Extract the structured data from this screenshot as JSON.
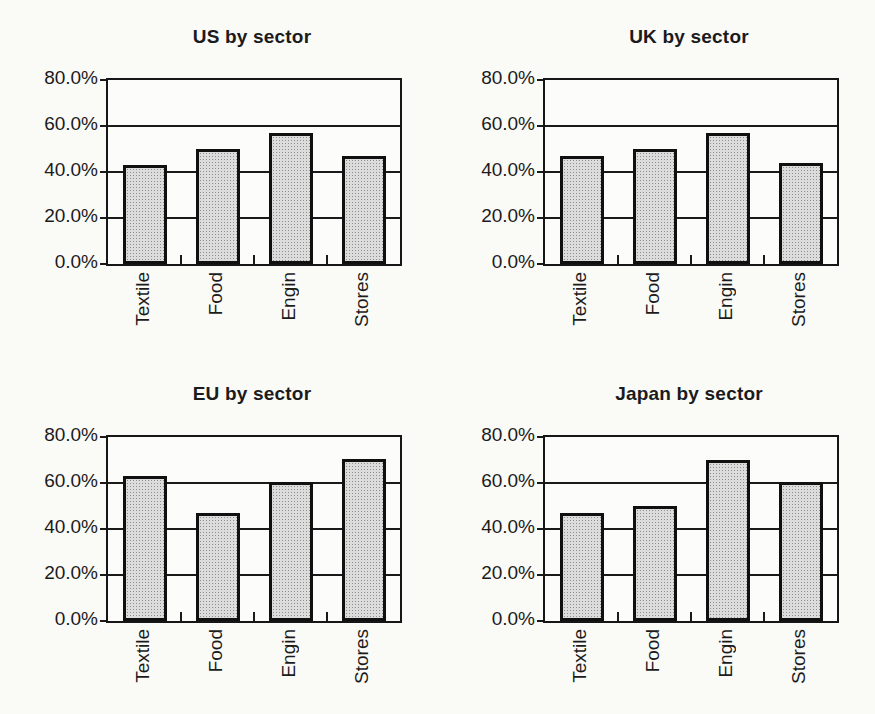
{
  "figure": {
    "background": "#fafaf7",
    "text_color": "#1b1b1b",
    "bar_fill": "#dcdcdc",
    "bar_border": "#101010"
  },
  "chart_data": [
    {
      "type": "bar",
      "title": "US by sector",
      "categories": [
        "Textile",
        "Food",
        "Engin",
        "Stores"
      ],
      "values": [
        43,
        50,
        57,
        47
      ],
      "xlabel": "",
      "ylabel": "",
      "ylim": [
        0,
        80
      ],
      "ytick_labels": [
        "80.0%",
        "60.0%",
        "40.0%",
        "20.0%",
        "0.0%"
      ],
      "ytick_values": [
        80,
        60,
        40,
        20,
        0
      ],
      "gridline_values": [
        20,
        40,
        60
      ],
      "grid": true,
      "legend": false,
      "bar_fill": "#dcdcdc",
      "bar_border": "#101010"
    },
    {
      "type": "bar",
      "title": "UK by sector",
      "categories": [
        "Textile",
        "Food",
        "Engin",
        "Stores"
      ],
      "values": [
        47,
        50,
        57,
        44
      ],
      "xlabel": "",
      "ylabel": "",
      "ylim": [
        0,
        80
      ],
      "ytick_labels": [
        "80.0%",
        "60.0%",
        "40.0%",
        "20.0%",
        "0.0%"
      ],
      "ytick_values": [
        80,
        60,
        40,
        20,
        0
      ],
      "gridline_values": [
        20,
        40,
        60
      ],
      "grid": true,
      "legend": false,
      "bar_fill": "#dcdcdc",
      "bar_border": "#101010"
    },
    {
      "type": "bar",
      "title": "EU by sector",
      "categories": [
        "Textile",
        "Food",
        "Engin",
        "Stores"
      ],
      "values": [
        63,
        47,
        60.5,
        70.5
      ],
      "xlabel": "",
      "ylabel": "",
      "ylim": [
        0,
        80
      ],
      "ytick_labels": [
        "80.0%",
        "60.0%",
        "40.0%",
        "20.0%",
        "0.0%"
      ],
      "ytick_values": [
        80,
        60,
        40,
        20,
        0
      ],
      "gridline_values": [
        20,
        40,
        60
      ],
      "grid": true,
      "legend": false,
      "bar_fill": "#dcdcdc",
      "bar_border": "#101010"
    },
    {
      "type": "bar",
      "title": "Japan by sector",
      "categories": [
        "Textile",
        "Food",
        "Engin",
        "Stores"
      ],
      "values": [
        47,
        50,
        70,
        60.5
      ],
      "xlabel": "",
      "ylabel": "",
      "ylim": [
        0,
        80
      ],
      "ytick_labels": [
        "80.0%",
        "60.0%",
        "40.0%",
        "20.0%",
        "0.0%"
      ],
      "ytick_values": [
        80,
        60,
        40,
        20,
        0
      ],
      "gridline_values": [
        20,
        40,
        60
      ],
      "grid": true,
      "legend": false,
      "bar_fill": "#dcdcdc",
      "bar_border": "#101010"
    }
  ]
}
